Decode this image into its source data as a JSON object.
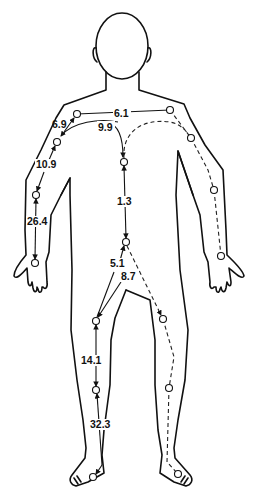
{
  "diagram": {
    "type": "human-body-signal-pathway",
    "labels": {
      "shoulder_span": "6.1",
      "shoulder_to_elbow_pt": "6.9",
      "chest_arc": "9.9",
      "upper_arm": "10.9",
      "forearm": "26.4",
      "torso": "1.3",
      "pelvis_to_left_knee": "5.1",
      "pelvis_to_right_knee": "8.7",
      "thigh": "14.1",
      "shin": "32.3"
    },
    "colors": {
      "line": "#111111",
      "background": "#ffffff"
    }
  }
}
